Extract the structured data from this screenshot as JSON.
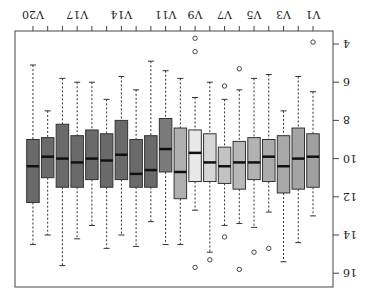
{
  "chart_data": {
    "type": "boxplot",
    "title": "",
    "xlabel": "",
    "ylabel": "",
    "ylim": [
      3.5,
      16.3
    ],
    "yticks": [
      4,
      6,
      8,
      10,
      12,
      14,
      16
    ],
    "categories": [
      "V1",
      "V2",
      "V3",
      "V4",
      "V5",
      "V6",
      "V7",
      "V8",
      "V9",
      "V10",
      "V11",
      "V12",
      "V13",
      "V14",
      "V15",
      "V16",
      "V17",
      "V18",
      "V19",
      "V20"
    ],
    "visible_tick_labels": [
      "V1",
      "V3",
      "V5",
      "V7",
      "V9",
      "V11",
      "V14",
      "V17",
      "V20"
    ],
    "orientation_note": "image rendered rotated 180 degrees",
    "series": [
      {
        "name": "V1",
        "whisker_low": 6.5,
        "q1": 8.7,
        "median": 9.9,
        "q3": 11.5,
        "whisker_high": 13.0,
        "outliers": [
          3.9
        ],
        "color": "#a0a0a0"
      },
      {
        "name": "V2",
        "whisker_low": 5.7,
        "q1": 8.4,
        "median": 10.0,
        "q3": 11.6,
        "whisker_high": 14.4,
        "outliers": [],
        "color": "#a4a4a4"
      },
      {
        "name": "V3",
        "whisker_low": 7.5,
        "q1": 8.8,
        "median": 10.4,
        "q3": 11.8,
        "whisker_high": 15.4,
        "outliers": [],
        "color": "#a8a8a8"
      },
      {
        "name": "V4",
        "whisker_low": 5.6,
        "q1": 9.0,
        "median": 9.9,
        "q3": 11.2,
        "whisker_high": 12.8,
        "outliers": [
          14.7
        ],
        "color": "#acacac"
      },
      {
        "name": "V5",
        "whisker_low": 5.8,
        "q1": 8.9,
        "median": 10.2,
        "q3": 11.1,
        "whisker_high": 13.6,
        "outliers": [
          14.9
        ],
        "color": "#b2b2b2"
      },
      {
        "name": "V6",
        "whisker_low": 6.4,
        "q1": 9.1,
        "median": 10.2,
        "q3": 11.6,
        "whisker_high": 13.4,
        "outliers": [
          5.3,
          15.8
        ],
        "color": "#b8b8b8"
      },
      {
        "name": "V7",
        "whisker_low": 6.9,
        "q1": 9.4,
        "median": 10.4,
        "q3": 11.3,
        "whisker_high": 13.5,
        "outliers": [
          6.2,
          14.1
        ],
        "color": "#c2c2c2"
      },
      {
        "name": "V8",
        "whisker_low": 6.0,
        "q1": 8.7,
        "median": 10.2,
        "q3": 11.2,
        "whisker_high": 14.9,
        "outliers": [
          15.3
        ],
        "color": "#d6d6d6"
      },
      {
        "name": "V9",
        "whisker_low": 6.8,
        "q1": 8.5,
        "median": 9.7,
        "q3": 11.2,
        "whisker_high": 12.7,
        "outliers": [
          3.7,
          4.4,
          15.7
        ],
        "color": "#e8e8e8"
      },
      {
        "name": "V10",
        "whisker_low": 5.8,
        "q1": 8.4,
        "median": 10.7,
        "q3": 12.1,
        "whisker_high": 14.5,
        "outliers": [],
        "color": "#b0b0b0"
      },
      {
        "name": "V11",
        "whisker_low": 5.4,
        "q1": 7.9,
        "median": 9.5,
        "q3": 10.7,
        "whisker_high": 14.5,
        "outliers": [],
        "color": "#7a7a7a"
      },
      {
        "name": "V12",
        "whisker_low": 4.9,
        "q1": 8.8,
        "median": 10.6,
        "q3": 11.5,
        "whisker_high": 13.3,
        "outliers": [],
        "color": "#6a6a6a"
      },
      {
        "name": "V13",
        "whisker_low": 6.4,
        "q1": 9.0,
        "median": 10.8,
        "q3": 11.5,
        "whisker_high": 14.6,
        "outliers": [],
        "color": "#6a6a6a"
      },
      {
        "name": "V14",
        "whisker_low": 5.7,
        "q1": 8.0,
        "median": 9.8,
        "q3": 11.1,
        "whisker_high": 14.0,
        "outliers": [],
        "color": "#6a6a6a"
      },
      {
        "name": "V15",
        "whisker_low": 6.9,
        "q1": 8.7,
        "median": 10.1,
        "q3": 11.5,
        "whisker_high": 14.7,
        "outliers": [],
        "color": "#6a6a6a"
      },
      {
        "name": "V16",
        "whisker_low": 6.0,
        "q1": 8.5,
        "median": 10.0,
        "q3": 11.1,
        "whisker_high": 13.5,
        "outliers": [],
        "color": "#6a6a6a"
      },
      {
        "name": "V17",
        "whisker_low": 6.0,
        "q1": 8.8,
        "median": 10.2,
        "q3": 11.5,
        "whisker_high": 14.2,
        "outliers": [],
        "color": "#6a6a6a"
      },
      {
        "name": "V18",
        "whisker_low": 5.8,
        "q1": 8.2,
        "median": 10.0,
        "q3": 11.5,
        "whisker_high": 15.6,
        "outliers": [],
        "color": "#6a6a6a"
      },
      {
        "name": "V19",
        "whisker_low": 7.5,
        "q1": 8.9,
        "median": 9.9,
        "q3": 11.0,
        "whisker_high": 14.0,
        "outliers": [],
        "color": "#6a6a6a"
      },
      {
        "name": "V20",
        "whisker_low": 5.1,
        "q1": 9.0,
        "median": 10.4,
        "q3": 12.3,
        "whisker_high": 14.5,
        "outliers": [],
        "color": "#6a6a6a"
      }
    ]
  }
}
